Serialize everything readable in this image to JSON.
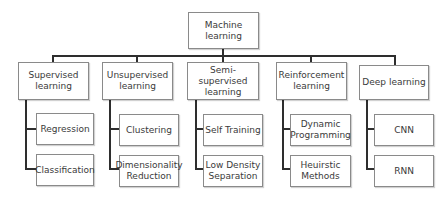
{
  "root": {
    "label": "Machine learning"
  },
  "categories": [
    {
      "label": "Supervised\nlearning",
      "children": [
        "Regression",
        "Classification"
      ]
    },
    {
      "label": "Unsupervised\nlearning",
      "children": [
        "Clustering",
        "Dimensionality\nReduction"
      ]
    },
    {
      "label": "Semi-supervised\nlearning",
      "children": [
        "Self Training",
        "Low Density\nSeparation"
      ]
    },
    {
      "label": "Reinforcement\nlearning",
      "children": [
        "Dynamic\nProgramming",
        "Heuirstic\nMethods"
      ]
    },
    {
      "label": "Deep learning",
      "children": [
        "CNN",
        "RNN"
      ]
    }
  ],
  "colors": {
    "line": "#2e2e2e",
    "border": "#8a8a8a",
    "text": "#3a3a3a"
  }
}
